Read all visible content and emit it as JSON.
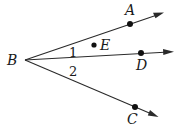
{
  "figure": {
    "vertex": {
      "label": "B",
      "x": 25,
      "y": 60
    },
    "rays": [
      {
        "name": "BA",
        "tip": [
          163,
          13
        ],
        "point": {
          "label": "A",
          "x": 130,
          "y": 24,
          "lx": 125,
          "ly": 15
        }
      },
      {
        "name": "BD",
        "tip": [
          173,
          52
        ],
        "point": {
          "label": "D",
          "x": 141,
          "y": 53,
          "lx": 136,
          "ly": 70
        }
      },
      {
        "name": "BC",
        "tip": [
          158,
          117
        ],
        "point": {
          "label": "C",
          "x": 135,
          "y": 107,
          "lx": 126,
          "ly": 124
        }
      }
    ],
    "interior_point": {
      "label": "E",
      "x": 94,
      "y": 45
    },
    "angle_labels": [
      {
        "text": "1",
        "x": 69,
        "y": 56
      },
      {
        "text": "2",
        "x": 69,
        "y": 76
      }
    ],
    "colors": {
      "stroke": "#2a2a2a",
      "text": "#1a1a1a"
    }
  }
}
